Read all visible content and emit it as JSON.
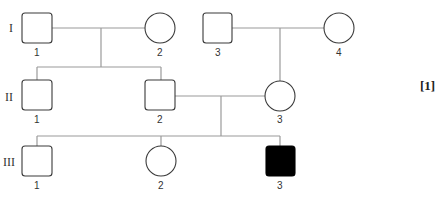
{
  "diagram": {
    "type": "pedigree",
    "generations": [
      "I",
      "II",
      "III"
    ],
    "individuals": [
      {
        "id": "I-1",
        "gen": "I",
        "label": "1",
        "sex": "male",
        "affected": false
      },
      {
        "id": "I-2",
        "gen": "I",
        "label": "2",
        "sex": "female",
        "affected": false
      },
      {
        "id": "I-3",
        "gen": "I",
        "label": "3",
        "sex": "male",
        "affected": false
      },
      {
        "id": "I-4",
        "gen": "I",
        "label": "4",
        "sex": "female",
        "affected": false
      },
      {
        "id": "II-1",
        "gen": "II",
        "label": "1",
        "sex": "male",
        "affected": false
      },
      {
        "id": "II-2",
        "gen": "II",
        "label": "2",
        "sex": "male",
        "affected": false
      },
      {
        "id": "II-3",
        "gen": "II",
        "label": "3",
        "sex": "female",
        "affected": false
      },
      {
        "id": "III-1",
        "gen": "III",
        "label": "1",
        "sex": "male",
        "affected": false
      },
      {
        "id": "III-2",
        "gen": "III",
        "label": "2",
        "sex": "female",
        "affected": false
      },
      {
        "id": "III-3",
        "gen": "III",
        "label": "3",
        "sex": "male",
        "affected": true
      }
    ],
    "matings": [
      {
        "partners": [
          "I-1",
          "I-2"
        ],
        "children": [
          "II-1",
          "II-2"
        ]
      },
      {
        "partners": [
          "I-3",
          "I-4"
        ],
        "children": [
          "II-3"
        ]
      },
      {
        "partners": [
          "II-2",
          "II-3"
        ],
        "children": [
          "III-1",
          "III-2",
          "III-3"
        ]
      }
    ],
    "marks": "[1]"
  },
  "labels": {
    "gen_I": "I",
    "gen_II": "II",
    "gen_III": "III",
    "I1": "1",
    "I2": "2",
    "I3": "3",
    "I4": "4",
    "II1": "1",
    "II2": "2",
    "II3": "3",
    "III1": "1",
    "III2": "2",
    "III3": "3",
    "marks": "[1]"
  }
}
